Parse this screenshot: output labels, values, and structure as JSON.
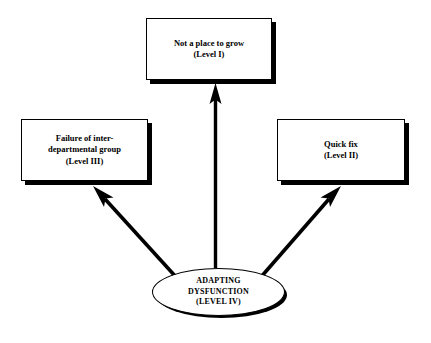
{
  "diagram": {
    "background_color": "#ffffff",
    "line_color": "#000000",
    "nodes": {
      "top": {
        "shape": "rectangle",
        "text": "Not a place to grow\n(Level I)",
        "label_line1": "Not a place to grow",
        "label_line2": "(Level I)",
        "level": "Level I"
      },
      "left": {
        "shape": "rectangle",
        "text": "Failure of inter-\ndepartmental group\n(Level III)",
        "label_line1": "Failure of inter-",
        "label_line2": "departmental group",
        "label_line3": "(Level III)",
        "level": "Level III"
      },
      "right": {
        "shape": "rectangle",
        "text": "Quick fix\n(Level II)",
        "label_line1": "Quick fix",
        "label_line2": "(Level II)",
        "level": "Level II"
      },
      "center": {
        "shape": "ellipse",
        "text": "ADAPTING\nDYSFUNCTION\n(LEVEL IV)",
        "label_line1": "ADAPTING",
        "label_line2": "DYSFUNCTION",
        "label_line3": "(LEVEL IV)",
        "level": "LEVEL IV"
      }
    },
    "arrows": [
      {
        "name": "arrow-center-to-top",
        "from": "center",
        "to": "top",
        "direction": "up"
      },
      {
        "name": "arrow-center-to-left",
        "from": "center",
        "to": "left",
        "direction": "up-left"
      },
      {
        "name": "arrow-center-to-right",
        "from": "center",
        "to": "right",
        "direction": "up-right"
      }
    ]
  }
}
